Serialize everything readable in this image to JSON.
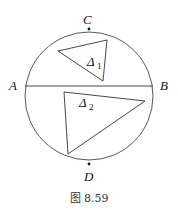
{
  "figure": {
    "caption": "图 8.59",
    "points": {
      "A": {
        "label": "A"
      },
      "B": {
        "label": "B"
      },
      "C": {
        "label": "C"
      },
      "D": {
        "label": "D"
      }
    },
    "triangles": [
      {
        "label": "Δ",
        "subscript": "1"
      },
      {
        "label": "Δ",
        "subscript": "2"
      }
    ],
    "colors": {
      "stroke": "#333333",
      "background": "#ffffff"
    }
  }
}
